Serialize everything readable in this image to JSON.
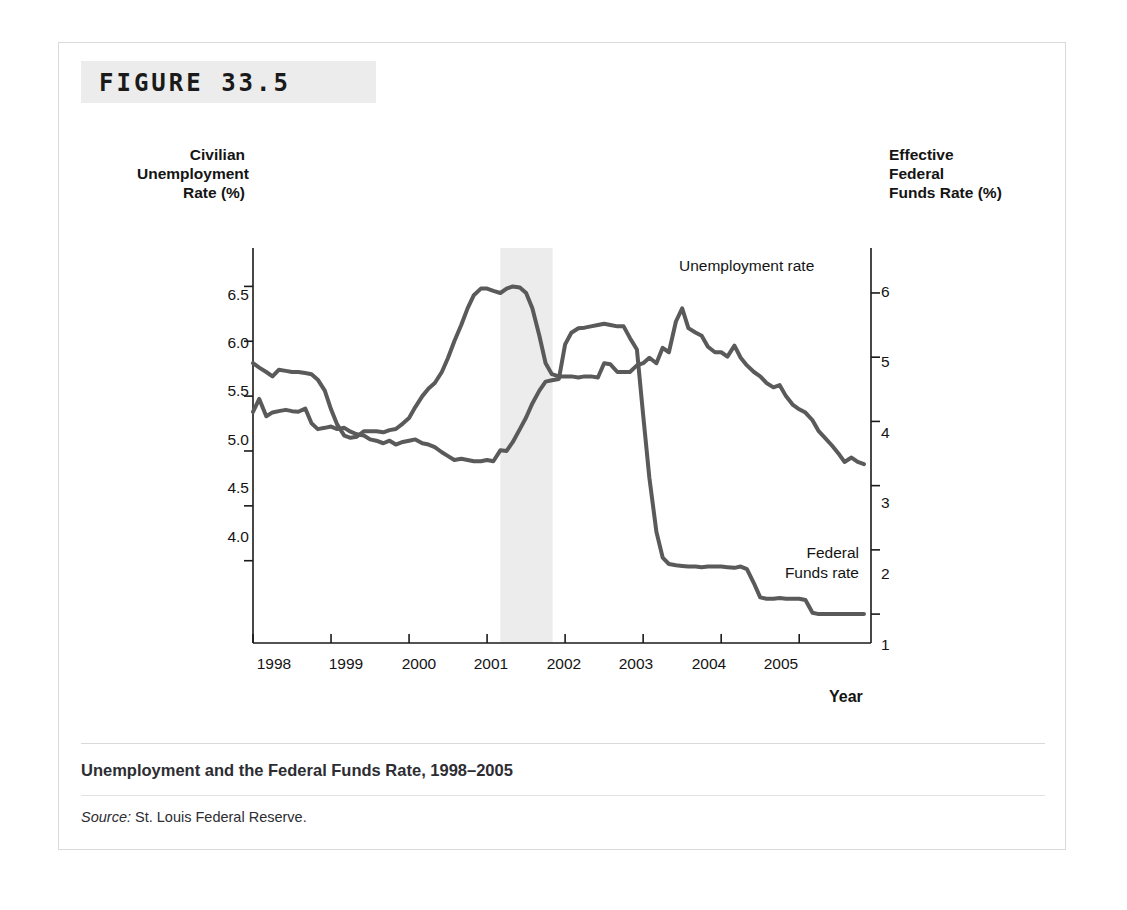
{
  "figure": {
    "number_label": "FIGURE 33.5",
    "caption_title": "Unemployment and the Federal Funds Rate, 1998–2005",
    "source_word": "Source:",
    "source_text": " St. Louis Federal Reserve."
  },
  "axes": {
    "left_title": "Civilian\nUnemployment\nRate (%)",
    "right_title": "Effective\nFederal\nFunds Rate (%)",
    "x_title": "Year",
    "left_ticks": [
      "6.5",
      "6.0",
      "5.5",
      "5.0",
      "4.5",
      "4.0"
    ],
    "right_ticks": [
      "6",
      "5",
      "4",
      "3",
      "2",
      "1"
    ],
    "x_ticks": [
      "1998",
      "1999",
      "2000",
      "2001",
      "2002",
      "2003",
      "2004",
      "2005"
    ]
  },
  "annotations": {
    "unemployment_label": "Unemployment rate",
    "federal_funds_label": "Federal\nFunds rate"
  },
  "colors": {
    "line": "#5a5a5a",
    "axis": "#1a1a1a",
    "recession_band": "#ececec",
    "frame": "#d9d9d9",
    "band": "#ececec"
  },
  "chart_data": {
    "type": "line",
    "title": "Unemployment and the Federal Funds Rate, 1998–2005",
    "xlabel": "Year",
    "ylabel": "Civilian Unemployment Rate (%)",
    "y2label": "Effective Federal Funds Rate (%)",
    "xlim": [
      1998.0,
      2005.92
    ],
    "ylim": [
      3.25,
      6.85
    ],
    "y2lim": [
      0.55,
      6.7
    ],
    "grid": false,
    "legend": "inline-annotations",
    "shaded_regions": [
      {
        "label": "recession",
        "x_start": 2001.17,
        "x_end": 2001.84,
        "color": "#ececec"
      }
    ],
    "series": [
      {
        "name": "Unemployment rate",
        "axis": "left",
        "units": "percent",
        "x": [
          1998.0,
          1998.08,
          1998.17,
          1998.25,
          1998.33,
          1998.42,
          1998.5,
          1998.58,
          1998.67,
          1998.75,
          1998.83,
          1998.92,
          1999.0,
          1999.08,
          1999.17,
          1999.25,
          1999.33,
          1999.42,
          1999.5,
          1999.58,
          1999.67,
          1999.75,
          1999.83,
          1999.92,
          2000.0,
          2000.08,
          2000.17,
          2000.25,
          2000.33,
          2000.42,
          2000.5,
          2000.58,
          2000.67,
          2000.75,
          2000.83,
          2000.92,
          2001.0,
          2001.08,
          2001.17,
          2001.25,
          2001.33,
          2001.42,
          2001.5,
          2001.58,
          2001.67,
          2001.75,
          2001.83,
          2001.92,
          2002.0,
          2002.08,
          2002.17,
          2002.25,
          2002.33,
          2002.42,
          2002.5,
          2002.58,
          2002.67,
          2002.75,
          2002.83,
          2002.92,
          2003.0,
          2003.08,
          2003.17,
          2003.25,
          2003.33,
          2003.42,
          2003.5,
          2003.58,
          2003.67,
          2003.75,
          2003.83,
          2003.92,
          2004.0,
          2004.08,
          2004.17,
          2004.25,
          2004.33,
          2004.42,
          2004.5,
          2004.58,
          2004.67,
          2004.75,
          2004.83,
          2004.92,
          2005.0,
          2005.08,
          2005.17,
          2005.25,
          2005.33,
          2005.42,
          2005.5,
          2005.58,
          2005.67,
          2005.75,
          2005.83
        ],
        "y": [
          5.8,
          5.76,
          5.72,
          5.68,
          5.74,
          5.73,
          5.72,
          5.72,
          5.71,
          5.7,
          5.65,
          5.55,
          5.38,
          5.24,
          5.14,
          5.12,
          5.13,
          5.18,
          5.18,
          5.18,
          5.17,
          5.19,
          5.2,
          5.25,
          5.3,
          5.4,
          5.5,
          5.57,
          5.62,
          5.72,
          5.85,
          6.0,
          6.15,
          6.3,
          6.42,
          6.48,
          6.48,
          6.46,
          6.44,
          6.48,
          6.5,
          6.49,
          6.44,
          6.3,
          6.05,
          5.8,
          5.7,
          5.68,
          5.68,
          5.68,
          5.67,
          5.68,
          5.68,
          5.67,
          5.8,
          5.79,
          5.72,
          5.72,
          5.72,
          5.78,
          5.8,
          5.85,
          5.8,
          5.94,
          5.9,
          6.18,
          6.3,
          6.12,
          6.08,
          6.05,
          5.95,
          5.9,
          5.9,
          5.86,
          5.96,
          5.85,
          5.78,
          5.72,
          5.68,
          5.62,
          5.58,
          5.6,
          5.5,
          5.42,
          5.38,
          5.35,
          5.28,
          5.18,
          5.12,
          5.05,
          4.98,
          4.9,
          4.94,
          4.9,
          4.88
        ]
      },
      {
        "name": "Federal Funds rate",
        "axis": "right",
        "units": "percent",
        "x": [
          1998.0,
          1998.08,
          1998.17,
          1998.25,
          1998.33,
          1998.42,
          1998.5,
          1998.58,
          1998.67,
          1998.75,
          1998.83,
          1998.92,
          1999.0,
          1999.08,
          1999.17,
          1999.25,
          1999.33,
          1999.42,
          1999.5,
          1999.58,
          1999.67,
          1999.75,
          1999.83,
          1999.92,
          2000.0,
          2000.08,
          2000.17,
          2000.25,
          2000.33,
          2000.42,
          2000.5,
          2000.58,
          2000.67,
          2000.75,
          2000.83,
          2000.92,
          2001.0,
          2001.08,
          2001.17,
          2001.25,
          2001.33,
          2001.42,
          2001.5,
          2001.58,
          2001.67,
          2001.75,
          2001.83,
          2001.92,
          2002.0,
          2002.08,
          2002.17,
          2002.25,
          2002.33,
          2002.42,
          2002.5,
          2002.58,
          2002.67,
          2002.75,
          2002.83,
          2002.92,
          2003.0,
          2003.08,
          2003.17,
          2003.25,
          2003.33,
          2003.42,
          2003.5,
          2003.58,
          2003.67,
          2003.75,
          2003.83,
          2003.92,
          2004.0,
          2004.08,
          2004.17,
          2004.25,
          2004.33,
          2004.42,
          2004.5,
          2004.58,
          2004.67,
          2004.75,
          2004.83,
          2004.92,
          2005.0,
          2005.08,
          2005.17,
          2005.25,
          2005.33,
          2005.42,
          2005.5,
          2005.58,
          2005.67,
          2005.75,
          2005.83
        ],
        "y": [
          4.15,
          4.35,
          4.08,
          4.14,
          4.16,
          4.18,
          4.16,
          4.15,
          4.2,
          3.97,
          3.88,
          3.9,
          3.92,
          3.88,
          3.9,
          3.84,
          3.8,
          3.78,
          3.72,
          3.7,
          3.66,
          3.7,
          3.64,
          3.68,
          3.7,
          3.72,
          3.66,
          3.64,
          3.6,
          3.52,
          3.46,
          3.4,
          3.42,
          3.4,
          3.38,
          3.38,
          3.4,
          3.38,
          3.55,
          3.54,
          3.68,
          3.88,
          4.06,
          4.28,
          4.48,
          4.62,
          4.64,
          4.66,
          5.2,
          5.38,
          5.45,
          5.46,
          5.48,
          5.5,
          5.52,
          5.5,
          5.48,
          5.48,
          5.3,
          5.12,
          4.1,
          3.12,
          2.28,
          1.88,
          1.78,
          1.76,
          1.75,
          1.74,
          1.74,
          1.73,
          1.74,
          1.74,
          1.74,
          1.73,
          1.72,
          1.74,
          1.7,
          1.48,
          1.26,
          1.24,
          1.24,
          1.25,
          1.24,
          1.24,
          1.24,
          1.22,
          1.02,
          1.0,
          1.0,
          1.0,
          1.0,
          1.0,
          1.0,
          1.0,
          1.0
        ]
      }
    ],
    "note": "Left-axis series is unemployment (values read on 4.0-6.5 scale). Right-axis series values listed here are expressed on the right-hand 1-6 federal funds scale."
  }
}
